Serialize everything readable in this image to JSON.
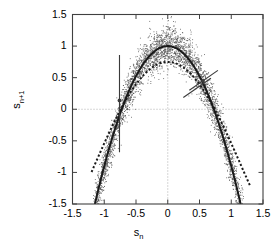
{
  "figure": {
    "title": "",
    "xlabel": "s",
    "xlabel_sub": "n",
    "ylabel": "s",
    "ylabel_sub": "n+1",
    "background": "#ffffff",
    "frame_color": "#404040",
    "grid_color": "#9a9a9a",
    "curve_color": "#1a1a1a",
    "scatter_color": "#555555",
    "errorbar_color": "#3a3a3a"
  },
  "axes": {
    "x_ticks": [
      "-1.5",
      "-1",
      "-0.5",
      "0",
      "0.5",
      "1",
      "1.5"
    ],
    "x_tick_values": [
      -1.5,
      -1,
      -0.5,
      0,
      0.5,
      1,
      1.5
    ],
    "y_ticks": [
      "-1.5",
      "-1",
      "-0.5",
      "0",
      "0.5",
      "1",
      "1.5"
    ],
    "y_tick_values": [
      -1.5,
      -1,
      -0.5,
      0,
      0.5,
      1,
      1.5
    ],
    "xlim": [
      -1.5,
      1.5
    ],
    "ylim": [
      -1.5,
      1.5
    ],
    "grid": "zero-lines-dotted"
  },
  "chart_data": {
    "type": "scatter",
    "title": "",
    "xlabel": "s_n",
    "ylabel": "s_n+1",
    "xlim": [
      -1.5,
      1.5
    ],
    "ylim": [
      -1.5,
      1.5
    ],
    "grid": "dotted zero lines at x=0 and y=0",
    "legend": "none",
    "series": [
      {
        "name": "scatter-cloud",
        "type": "scatter",
        "marker": "dot",
        "color": "#555555",
        "n_points": 4000,
        "description": "Noisy return-map cloud distributed about the quadratic map s_{n+1} = 1 - 1.9*s_n^2, spread roughly +/-0.28 in the vertical direction, densest near the apex and thinning toward the arms.",
        "model_a": 1.9,
        "model_c": 1.0,
        "noise_sigma": 0.16,
        "x_range": [
          -1.28,
          1.3
        ]
      },
      {
        "name": "solid-parabola",
        "type": "line",
        "style": "solid",
        "color": "#1a1a1a",
        "width": 2.0,
        "equation": "y = 1 - 1.9 x^2",
        "vertex": [
          0,
          1.0
        ],
        "x_range": [
          -1.22,
          1.22
        ],
        "description": "Fitted / true quadratic map, peak value 1.0 at x = 0, crosses y = 0 near x = +/-0.725."
      },
      {
        "name": "dotted-curve",
        "type": "line",
        "style": "dotted",
        "color": "#1a1a1a",
        "width": 2.0,
        "equation": "y = 0.75 - 1.47 x^2 + 0.18 x^4",
        "vertex": [
          0,
          0.75
        ],
        "x_range": [
          -1.2,
          1.3
        ],
        "description": "Second (estimated) map curve, lower apex 0.75 at x = 0, flanks lying close to the solid parabola for |x| > 0.7 and extending slightly further right."
      }
    ],
    "annotations": [
      {
        "name": "vertical-error-bar",
        "type": "errorbar",
        "orientation": "vertical",
        "x": -0.76,
        "y": 0.14,
        "y_low": -0.68,
        "y_high": 0.86,
        "marker": "filled-dot",
        "color": "#3a3a3a"
      },
      {
        "name": "tangent-error-bar",
        "type": "errorbar",
        "orientation": "diagonal",
        "x": 0.555,
        "y": 0.45,
        "x1": 0.34,
        "y1": 0.3,
        "x2": 0.79,
        "y2": 0.615,
        "marker": "filled-dot",
        "color": "#3a3a3a"
      },
      {
        "name": "secondary-diagonal-bar",
        "type": "errorbar",
        "orientation": "diagonal",
        "x": 0.46,
        "y": 0.33,
        "x1": 0.245,
        "y1": 0.185,
        "x2": 0.68,
        "y2": 0.49,
        "color": "#3a3a3a"
      }
    ]
  }
}
